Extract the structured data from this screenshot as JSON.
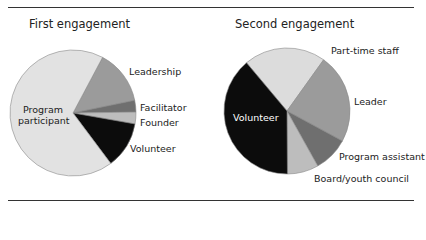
{
  "chart_data": [
    {
      "type": "pie",
      "title": "First engagement",
      "categories": [
        "Program participant",
        "Leadership",
        "Facilitator",
        "Founder",
        "Volunteer"
      ],
      "values": [
        68,
        14,
        3,
        3,
        12
      ],
      "units": "percent (estimated from slice angles)",
      "colors": [
        "#e2e2e2",
        "#9b9b9b",
        "#6f6f6f",
        "#bdbdbd",
        "#0c0c0c"
      ],
      "legend": "none (direct labels)"
    },
    {
      "type": "pie",
      "title": "Second engagement",
      "categories": [
        "Part-time staff",
        "Leader",
        "Program assistant",
        "Board/youth council",
        "Volunteer"
      ],
      "values": [
        21,
        23,
        9,
        8,
        39
      ],
      "units": "percent (estimated from slice angles)",
      "colors": [
        "#dcdcdc",
        "#9b9b9b",
        "#6f6f6f",
        "#bdbdbd",
        "#0c0c0c"
      ],
      "legend": "none (direct labels)"
    }
  ],
  "charts": {
    "first": {
      "title": "First engagement",
      "labels": {
        "program_participant_1": "Program",
        "program_participant_2": "participant",
        "leadership": "Leadership",
        "facilitator": "Facilitator",
        "founder": "Founder",
        "volunteer": "Volunteer"
      }
    },
    "second": {
      "title": "Second engagement",
      "labels": {
        "part_time_staff": "Part-time staff",
        "leader": "Leader",
        "program_assistant": "Program assistant",
        "board": "Board/youth council",
        "volunteer": "Volunteer"
      }
    }
  }
}
